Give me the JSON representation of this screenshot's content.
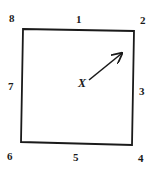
{
  "diagram": {
    "type": "square-with-numbered-positions",
    "positions": [
      {
        "label": "1",
        "location": "top-middle"
      },
      {
        "label": "2",
        "location": "top-right"
      },
      {
        "label": "3",
        "location": "right-middle"
      },
      {
        "label": "4",
        "location": "bottom-right"
      },
      {
        "label": "5",
        "location": "bottom-middle"
      },
      {
        "label": "6",
        "location": "bottom-left"
      },
      {
        "label": "7",
        "location": "left-middle"
      },
      {
        "label": "8",
        "location": "top-left"
      }
    ],
    "center_label": "X",
    "arrow": {
      "from": "center",
      "direction": "toward position 2 (upper-right)"
    }
  },
  "colors": {
    "stroke": "#1a1a1a",
    "background": "#ffffff"
  }
}
